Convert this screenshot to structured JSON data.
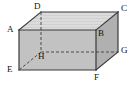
{
  "figure": {
    "type": "geometric-diagram",
    "shape": "rectangular-prism-cuboid",
    "projection": "oblique",
    "colors": {
      "top_face": "#d9d9d9",
      "front_face": "#c2c2c2",
      "right_face": "#b0b0b0",
      "edge": "#3a3a3a",
      "hidden_edge": "#4a4a4a",
      "label_text": "#111111",
      "background": "#ffffff"
    },
    "vertices": [
      {
        "id": "A",
        "label": "A",
        "x": 19,
        "y": 30,
        "hidden": false,
        "label_x": 7,
        "label_y": 25
      },
      {
        "id": "B",
        "label": "B",
        "x": 96,
        "y": 30,
        "hidden": false,
        "label_x": 98,
        "label_y": 29
      },
      {
        "id": "C",
        "label": "C",
        "x": 118,
        "y": 12,
        "hidden": false,
        "label_x": 121,
        "label_y": 4
      },
      {
        "id": "D",
        "label": "D",
        "x": 41,
        "y": 12,
        "hidden": false,
        "label_x": 34,
        "label_y": 2
      },
      {
        "id": "E",
        "label": "E",
        "x": 19,
        "y": 70,
        "hidden": false,
        "label_x": 7,
        "label_y": 65
      },
      {
        "id": "F",
        "label": "F",
        "x": 96,
        "y": 70,
        "hidden": false,
        "label_x": 94,
        "label_y": 73
      },
      {
        "id": "G",
        "label": "G",
        "x": 118,
        "y": 52,
        "hidden": false,
        "label_x": 121,
        "label_y": 46
      },
      {
        "id": "H",
        "label": "H",
        "x": 41,
        "y": 52,
        "hidden": true,
        "label_x": 38,
        "label_y": 52
      }
    ],
    "faces": [
      {
        "name": "top-face-ADCB",
        "vertices": "A,D,C,B",
        "points": "19,30 41,12 118,12 96,30",
        "fill": "#d9d9d9",
        "striped": true
      },
      {
        "name": "front-face-ABFE",
        "vertices": "A,B,F,E",
        "points": "19,30 96,30 96,70 19,70",
        "fill": "#c2c2c2",
        "striped": false
      },
      {
        "name": "right-face-BCGF",
        "vertices": "B,C,G,F",
        "points": "96,30 118,12 118,52 96,70",
        "fill": "#b0b0b0",
        "striped": false
      }
    ],
    "visible_edges": [
      {
        "name": "edge-AD",
        "from": "A",
        "to": "D"
      },
      {
        "name": "edge-DC",
        "from": "D",
        "to": "C"
      },
      {
        "name": "edge-CB",
        "from": "C",
        "to": "B"
      },
      {
        "name": "edge-AB",
        "from": "A",
        "to": "B"
      },
      {
        "name": "edge-AE",
        "from": "A",
        "to": "E"
      },
      {
        "name": "edge-BF",
        "from": "B",
        "to": "F"
      },
      {
        "name": "edge-EF",
        "from": "E",
        "to": "F"
      },
      {
        "name": "edge-CG",
        "from": "C",
        "to": "G"
      },
      {
        "name": "edge-FG",
        "from": "F",
        "to": "G"
      }
    ],
    "hidden_edges": [
      {
        "name": "edge-DH",
        "from": "D",
        "to": "H"
      },
      {
        "name": "edge-HE",
        "from": "H",
        "to": "E"
      },
      {
        "name": "edge-HG",
        "from": "H",
        "to": "G"
      }
    ]
  }
}
